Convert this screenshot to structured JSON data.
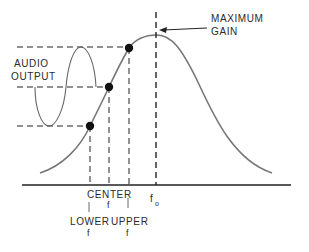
{
  "diagram": {
    "type": "resonance-curve",
    "labels": {
      "maximum_gain_line1": "MAXIMUM",
      "maximum_gain_line2": "GAIN",
      "audio_output_line1": "AUDIO",
      "audio_output_line2": "OUTPUT",
      "center": "CENTER",
      "center_f": "f",
      "f0_main": "f",
      "f0_sub": "o",
      "lower": "LOWER",
      "lower_f": "f",
      "upper": "UPPER",
      "upper_f": "f"
    },
    "points": [
      {
        "name": "lower",
        "x": 90,
        "y": 126
      },
      {
        "name": "center",
        "x": 109,
        "y": 87
      },
      {
        "name": "upper",
        "x": 129,
        "y": 48
      }
    ],
    "colors": {
      "curve": "#777777",
      "ink": "#222222",
      "background": "#ffffff"
    }
  }
}
